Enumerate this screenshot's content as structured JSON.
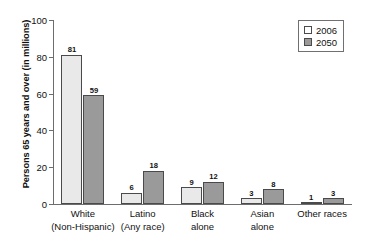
{
  "chart_data": {
    "type": "bar",
    "title": "",
    "xlabel": "",
    "ylabel": "Persons 65 years and over (in millions)",
    "ylim": [
      0,
      100
    ],
    "yticks": [
      0,
      20,
      40,
      60,
      80,
      100
    ],
    "ytick_labels": [
      "0",
      "20",
      "40",
      "60",
      "80",
      "100"
    ],
    "grid": false,
    "legend_position": "top-right",
    "categories": [
      {
        "line1": "White",
        "line2": "(Non-Hispanic)"
      },
      {
        "line1": "Latino",
        "line2": "(Any race)"
      },
      {
        "line1": "Black",
        "line2": "alone"
      },
      {
        "line1": "Asian",
        "line2": "alone"
      },
      {
        "line1": "Other races",
        "line2": ""
      }
    ],
    "series": [
      {
        "name": "2006",
        "color": "#e9e9e9",
        "values": [
          81,
          6,
          9,
          3,
          1
        ],
        "labels": [
          "81",
          "6",
          "9",
          "3",
          "1"
        ]
      },
      {
        "name": "2050",
        "color": "#9a9a9a",
        "values": [
          59,
          18,
          12,
          8,
          3
        ],
        "labels": [
          "59",
          "18",
          "12",
          "8",
          "3"
        ]
      }
    ]
  },
  "legend": {
    "entries": [
      {
        "label": "2006"
      },
      {
        "label": "2050"
      }
    ]
  },
  "colors": {
    "series_2006": "#e9e9e9",
    "series_2050": "#9a9a9a",
    "axis": "#6d6d6d",
    "text": "#111111"
  }
}
